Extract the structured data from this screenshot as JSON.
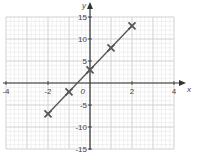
{
  "chart_data": {
    "type": "line",
    "title": "",
    "xlabel": "x",
    "ylabel": "y",
    "xlim": [
      -4,
      4
    ],
    "ylim": [
      -15,
      15
    ],
    "grid": true,
    "x_ticks": [
      -4,
      -2,
      2,
      4
    ],
    "x_tick_labels": [
      "-4",
      "-2",
      "2",
      "4"
    ],
    "y_ticks": [
      -15,
      -10,
      -5,
      5,
      10,
      15
    ],
    "y_tick_labels": [
      "-15",
      "-10",
      "-5",
      "5",
      "10",
      "15"
    ],
    "origin_label": "0",
    "series": [
      {
        "name": "y = 5x + 3",
        "marker": "x",
        "points": [
          {
            "x": -2,
            "y": -7
          },
          {
            "x": -1,
            "y": -2
          },
          {
            "x": 0,
            "y": 3
          },
          {
            "x": 1,
            "y": 8
          },
          {
            "x": 2,
            "y": 13
          }
        ]
      }
    ]
  },
  "colors": {
    "grid_minor": "#e4e4e4",
    "grid_major": "#c8c8c8",
    "axis": "#333333",
    "line": "#555555",
    "marker": "#555555",
    "text": "#444444"
  }
}
